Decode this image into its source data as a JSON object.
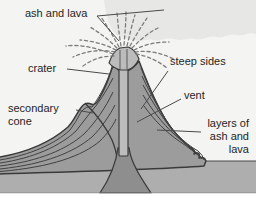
{
  "labels": {
    "ash_and_lava": "ash and lava",
    "steep_sides": "steep sides",
    "crater": "crater",
    "vent": "vent",
    "secondary_cone": "secondary cone",
    "layers_of_ash_and_lava": "layers of ash and lava"
  },
  "colors": {
    "sky": "#f4f4f2",
    "ash_cloud": "#e7e7e5",
    "cone_fill": "#9c9c9c",
    "outline": "#3a3a3a",
    "underground": "#aeaeae",
    "magma_conduit": "#8e8e8e",
    "vent_fill": "#bcbcbc",
    "spray": "#7d7d7d",
    "text": "#1f1f1f",
    "page_margin": "#ffffff"
  }
}
